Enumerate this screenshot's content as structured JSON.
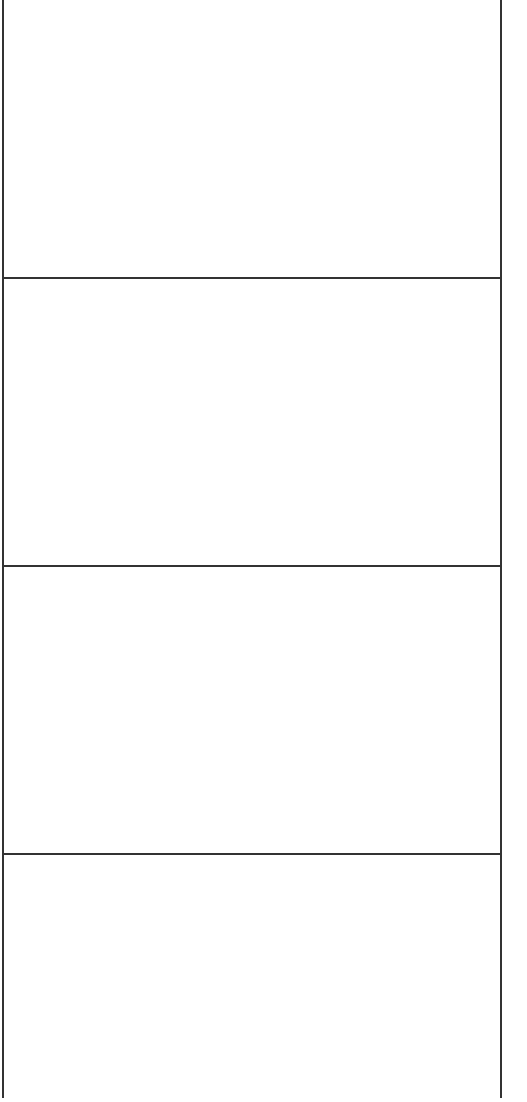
{
  "diagram": {
    "type": "stacked-rectangles",
    "stroke_color": "#333333",
    "fill_color": "#ffffff",
    "panels": [
      {
        "index": 0,
        "label": "",
        "top": -2,
        "height": 280
      },
      {
        "index": 1,
        "label": "",
        "top": 278,
        "height": 288
      },
      {
        "index": 2,
        "label": "",
        "top": 566,
        "height": 288
      },
      {
        "index": 3,
        "label": "",
        "top": 854,
        "height": 246
      }
    ]
  }
}
